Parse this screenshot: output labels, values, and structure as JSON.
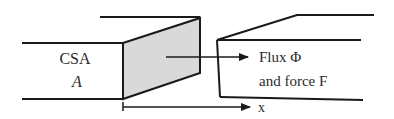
{
  "figure": {
    "left_label_line1": "CSA",
    "left_label_line2": "A",
    "flux_label": "Flux Φ",
    "force_label": "and force F",
    "axis_label": "x",
    "colors": {
      "stroke": "#1a1a1a",
      "shaded_face": "#d9d9d9",
      "background": "#ffffff"
    }
  }
}
